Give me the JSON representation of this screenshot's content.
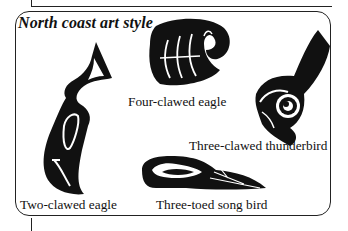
{
  "figure": {
    "title": "North coast art style",
    "items": [
      {
        "id": "four-clawed-eagle",
        "label": "Four-clawed eagle"
      },
      {
        "id": "three-clawed-thunderbird",
        "label": "Three-clawed thunderbird"
      },
      {
        "id": "two-clawed-eagle",
        "label": "Two-clawed eagle"
      },
      {
        "id": "three-toed-song-bird",
        "label": "Three-toed song bird"
      }
    ],
    "colors": {
      "ink": "#111111",
      "background": "#ffffff",
      "border": "#222222"
    }
  }
}
